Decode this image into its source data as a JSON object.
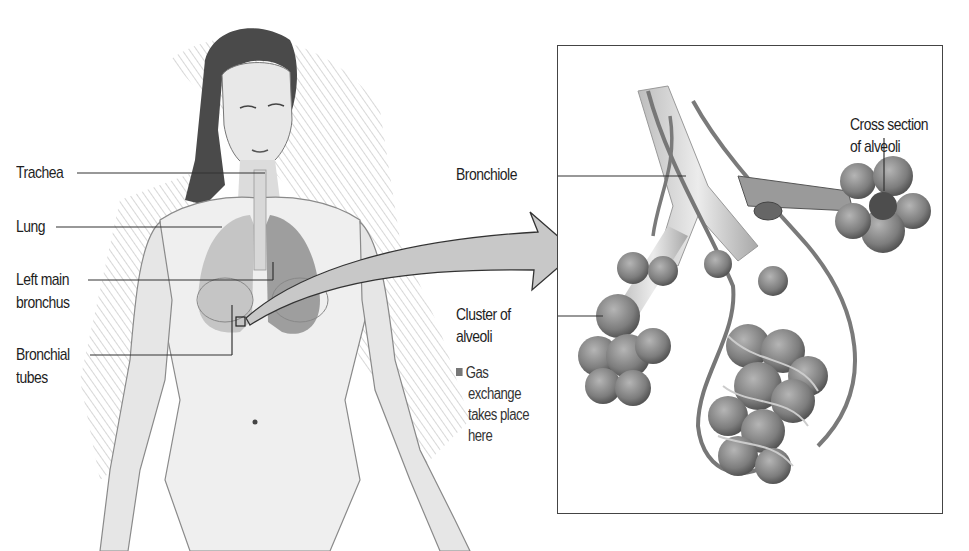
{
  "figure": {
    "left_labels": [
      {
        "text": "Trachea"
      },
      {
        "text": "Lung"
      },
      {
        "text": "Left main",
        "text2": "bronchus"
      },
      {
        "text": "Bronchial",
        "text2": "tubes"
      }
    ],
    "inset_labels": {
      "bronchiole": "Bronchiole",
      "cluster_line1": "Cluster of",
      "cluster_line2": "alveoli",
      "cross_line1": "Cross section",
      "cross_line2": "of alveoli"
    },
    "note": {
      "line1": "Gas",
      "line2": "exchange",
      "line3": "takes place",
      "line4": "here"
    },
    "colors": {
      "line": "#333333",
      "arrow_fill": "#c8c8c8",
      "alveoli": "#8a8a8a",
      "skin_shade": "#9a9a9a"
    }
  }
}
